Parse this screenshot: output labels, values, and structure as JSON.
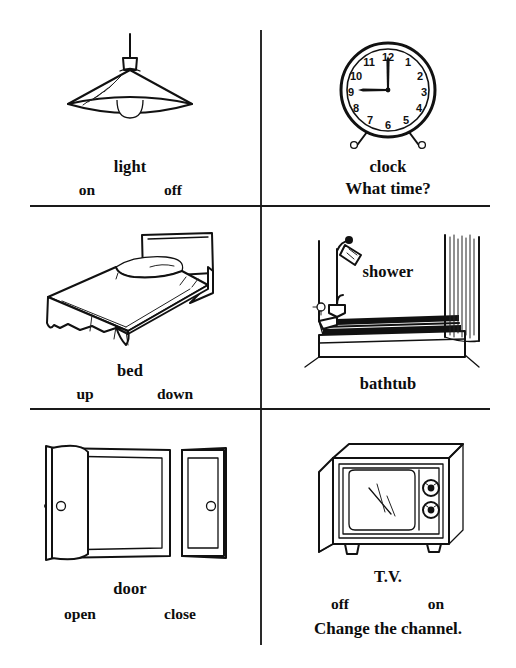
{
  "page": {
    "background_color": "#ffffff",
    "ink_color": "#111111"
  },
  "cells": [
    {
      "id": "light",
      "illustration": "hanging-lamp",
      "main_label": "light",
      "options": [
        "on",
        "off"
      ],
      "phrase": ""
    },
    {
      "id": "clock",
      "illustration": "alarm-clock",
      "main_label": "clock",
      "options": [],
      "phrase": "What time?",
      "clock_numerals": [
        "12",
        "1",
        "2",
        "3",
        "4",
        "5",
        "6",
        "7",
        "8",
        "9",
        "10",
        "11"
      ],
      "clock_time": "9:00"
    },
    {
      "id": "bed",
      "illustration": "bed",
      "main_label": "bed",
      "options": [
        "up",
        "down"
      ],
      "phrase": ""
    },
    {
      "id": "bathtub",
      "illustration": "bathtub-with-shower",
      "main_label": "bathtub",
      "options": [],
      "phrase": "",
      "inline_label": "shower"
    },
    {
      "id": "door",
      "illustration": "two-doors-open-and-closed",
      "main_label": "door",
      "options": [
        "open",
        "close"
      ],
      "phrase": ""
    },
    {
      "id": "tv",
      "illustration": "television-set",
      "main_label": "T.V.",
      "options": [
        "off",
        "on"
      ],
      "phrase": "Change the channel."
    }
  ]
}
